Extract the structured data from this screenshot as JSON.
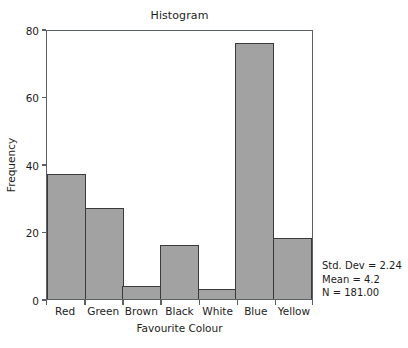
{
  "chart_data": {
    "type": "bar",
    "title": "Histogram",
    "xlabel": "Favourite Colour",
    "ylabel": "Frequency",
    "categories": [
      "Red",
      "Green",
      "Brown",
      "Black",
      "White",
      "Blue",
      "Yellow"
    ],
    "values": [
      37,
      27,
      4,
      16,
      3,
      76,
      18
    ],
    "ylim": [
      0,
      80
    ],
    "yticks": [
      0,
      20,
      40,
      60,
      80
    ],
    "ytick_labels": [
      "0",
      "20",
      "40",
      "60",
      "80"
    ],
    "grid": false,
    "legend": "none",
    "bar_fill_color": "#a2a2a2",
    "bar_edge_color": "#3a3a3a",
    "frame_color": "#5b5f66",
    "background_color": "#ffffff",
    "annotations": {
      "std_dev": "Std. Dev = 2.24",
      "mean": "Mean = 4.2",
      "n": "N = 181.00"
    }
  }
}
